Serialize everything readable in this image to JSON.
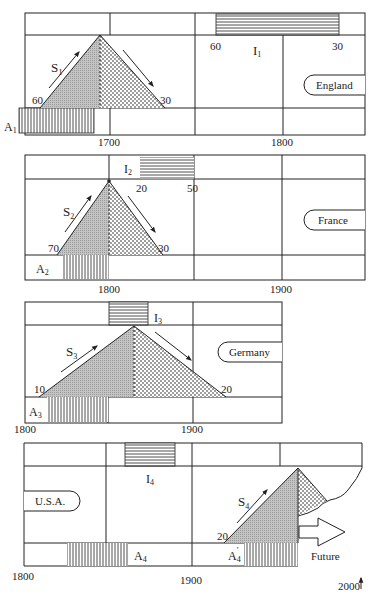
{
  "colors": {
    "line": "#222222",
    "rise_fill": "#bdbdbd",
    "dot_fill": "#222222",
    "background": "#ffffff"
  },
  "legend_patterns": {
    "S": "triangle: rising (gray) and falling (dotted) phases",
    "I": "horizontal hatched bar",
    "A": "vertical hatched bar"
  },
  "panels": [
    {
      "country": "England",
      "series_label": "S",
      "series_sub": "1",
      "i_label": "I",
      "i_sub": "1",
      "a_label": "A",
      "a_sub": "1",
      "left_value": "60",
      "right_value": "30",
      "i_start_value": "60",
      "i_end_value": "30",
      "axis_labels": [
        "1700",
        "1800"
      ]
    },
    {
      "country": "France",
      "series_label": "S",
      "series_sub": "2",
      "i_label": "I",
      "i_sub": "2",
      "a_label": "A",
      "a_sub": "2",
      "left_value": "70",
      "right_value": "30",
      "i_start_value": "20",
      "i_end_value": "50",
      "axis_labels": [
        "1800",
        "1900"
      ]
    },
    {
      "country": "Germany",
      "series_label": "S",
      "series_sub": "3",
      "i_label": "I",
      "i_sub": "3",
      "a_label": "A",
      "a_sub": "3",
      "left_value": "10",
      "right_value": "20",
      "axis_labels": [
        "1800",
        "1900"
      ]
    },
    {
      "country": "U.S.A.",
      "series_label": "S",
      "series_sub": "4",
      "i_label": "I",
      "i_sub": "4",
      "a_label": "A",
      "a_sub": "4",
      "a2_label": "A",
      "a2_sub": "4",
      "a2_prime": "′",
      "left_value": "20",
      "future_label": "Future",
      "axis_labels": [
        "1800",
        "1900",
        "2000"
      ]
    }
  ]
}
